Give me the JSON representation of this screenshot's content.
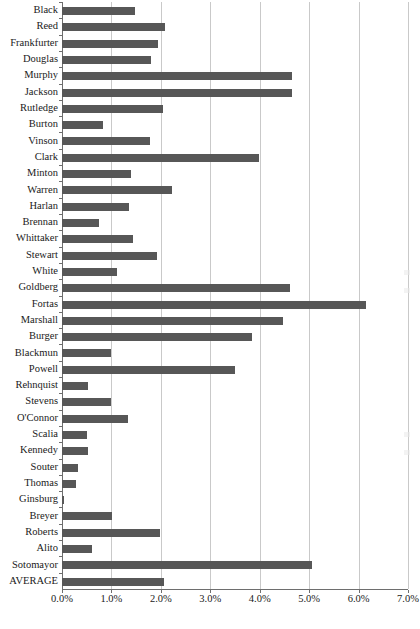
{
  "chart_data": {
    "type": "bar",
    "orientation": "horizontal",
    "title": "",
    "xlabel": "",
    "ylabel": "",
    "xlim": [
      0,
      7
    ],
    "x_tick_labels": [
      "0.0%",
      "1.0%",
      "2.0%",
      "3.0%",
      "4.0%",
      "5.0%",
      "6.0%",
      "7.0%"
    ],
    "x_tick_values": [
      0,
      1,
      2,
      3,
      4,
      5,
      6,
      7
    ],
    "grid": "vertical",
    "legend": "none",
    "value_unit": "%",
    "bar_color": "#575757",
    "gridline_color": "#c9c9c9",
    "axis_color": "#6e6e6e",
    "background_color": "#ffffff",
    "categories": [
      "Black",
      "Reed",
      "Frankfurter",
      "Douglas",
      "Murphy",
      "Jackson",
      "Rutledge",
      "Burton",
      "Vinson",
      "Clark",
      "Minton",
      "Warren",
      "Harlan",
      "Brennan",
      "Whittaker",
      "Stewart",
      "White",
      "Goldberg",
      "Fortas",
      "Marshall",
      "Burger",
      "Blackmun",
      "Powell",
      "Rehnquist",
      "Stevens",
      "O'Connor",
      "Scalia",
      "Kennedy",
      "Souter",
      "Thomas",
      "Ginsburg",
      "Breyer",
      "Roberts",
      "Alito",
      "Sotomayor",
      "AVERAGE"
    ],
    "values": [
      1.47,
      2.09,
      1.95,
      1.81,
      4.65,
      4.65,
      2.05,
      0.82,
      1.78,
      3.99,
      1.39,
      2.23,
      1.35,
      0.74,
      1.43,
      1.93,
      1.12,
      4.62,
      6.16,
      4.48,
      3.85,
      1.0,
      3.49,
      0.53,
      1.0,
      1.34,
      0.51,
      0.52,
      0.32,
      0.28,
      0.05,
      1.01,
      1.99,
      0.61,
      5.05,
      2.06
    ]
  }
}
